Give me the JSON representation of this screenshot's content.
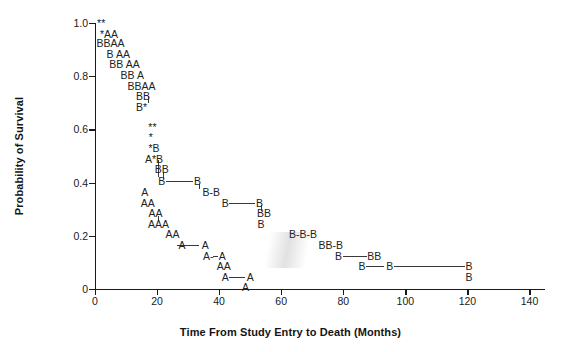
{
  "figure": {
    "background": "#ffffff",
    "ink": "#1a1a1a"
  },
  "axes": {
    "x_title": "Time From Study Entry to Death (Months)",
    "y_title": "Probability of Survival",
    "x_ticks": [
      "0",
      "20",
      "40",
      "60",
      "80",
      "100",
      "120",
      "140"
    ],
    "x_tick_values": [
      0,
      20,
      40,
      60,
      80,
      100,
      120,
      140
    ],
    "y_ticks": [
      "0",
      "0.2",
      "0.4",
      "0.6",
      "0.8",
      "1.0"
    ],
    "y_tick_values": [
      0,
      0.2,
      0.4,
      0.6,
      0.8,
      1.0
    ],
    "xlim": [
      0,
      145
    ],
    "ylim": [
      0,
      1.0
    ],
    "grid": false
  },
  "legend": {
    "present": false,
    "marker_meanings": [
      {
        "symbol": "A",
        "meaning": "group-a-observation"
      },
      {
        "symbol": "B",
        "meaning": "group-b-observation"
      },
      {
        "symbol": "*",
        "meaning": "censored-observation"
      }
    ]
  },
  "chart_data": {
    "type": "line",
    "title": "",
    "subtitle": "",
    "xlabel": "Time From Study Entry to Death (Months)",
    "ylabel": "Probability of Survival",
    "xlim": [
      0,
      145
    ],
    "ylim": [
      0,
      1.0
    ],
    "grid": false,
    "legend_position": "none",
    "plot_style": "kaplan-meier-step-with-text-markers",
    "series": [
      {
        "name": "A",
        "marker": "A",
        "points": [
          {
            "x": 3.5,
            "y": 0.96
          },
          {
            "x": 6.0,
            "y": 0.96
          },
          {
            "x": 5.0,
            "y": 0.925
          },
          {
            "x": 7.5,
            "y": 0.925
          },
          {
            "x": 8.5,
            "y": 0.885
          },
          {
            "x": 11.0,
            "y": 0.885
          },
          {
            "x": 11.0,
            "y": 0.845
          },
          {
            "x": 13.5,
            "y": 0.845
          },
          {
            "x": 13.5,
            "y": 0.805
          },
          {
            "x": 15.5,
            "y": 0.765
          },
          {
            "x": 18.0,
            "y": 0.765
          },
          {
            "x": 19.0,
            "y": 0.49
          },
          {
            "x": 15.5,
            "y": 0.405
          },
          {
            "x": 15.5,
            "y": 0.365
          },
          {
            "x": 18.0,
            "y": 0.365
          },
          {
            "x": 18.5,
            "y": 0.325
          },
          {
            "x": 21.0,
            "y": 0.325
          },
          {
            "x": 18.5,
            "y": 0.245
          },
          {
            "x": 21.0,
            "y": 0.245
          },
          {
            "x": 23.5,
            "y": 0.245
          },
          {
            "x": 24.5,
            "y": 0.205
          },
          {
            "x": 27.0,
            "y": 0.205
          },
          {
            "x": 27.0,
            "y": 0.165
          },
          {
            "x": 34.0,
            "y": 0.165
          },
          {
            "x": 36.0,
            "y": 0.125
          },
          {
            "x": 40.0,
            "y": 0.125
          },
          {
            "x": 40.0,
            "y": 0.085
          },
          {
            "x": 42.5,
            "y": 0.085
          },
          {
            "x": 41.5,
            "y": 0.045
          },
          {
            "x": 49.5,
            "y": 0.045
          },
          {
            "x": 48.5,
            "y": 0.008
          }
        ]
      },
      {
        "name": "B",
        "marker": "B",
        "points": [
          {
            "x": 2.5,
            "y": 0.925
          },
          {
            "x": 5.0,
            "y": 0.925
          },
          {
            "x": 3.5,
            "y": 0.885
          },
          {
            "x": 4.5,
            "y": 0.845
          },
          {
            "x": 7.0,
            "y": 0.845
          },
          {
            "x": 6.5,
            "y": 0.805
          },
          {
            "x": 9.0,
            "y": 0.805
          },
          {
            "x": 8.5,
            "y": 0.765
          },
          {
            "x": 11.0,
            "y": 0.765
          },
          {
            "x": 10.5,
            "y": 0.725
          },
          {
            "x": 13.0,
            "y": 0.725
          },
          {
            "x": 12.0,
            "y": 0.645
          },
          {
            "x": 18.5,
            "y": 0.53
          },
          {
            "x": 19.5,
            "y": 0.49
          },
          {
            "x": 20.5,
            "y": 0.45
          },
          {
            "x": 23.0,
            "y": 0.45
          },
          {
            "x": 22.5,
            "y": 0.405
          },
          {
            "x": 33.0,
            "y": 0.405
          },
          {
            "x": 33.0,
            "y": 0.365
          },
          {
            "x": 37.0,
            "y": 0.365
          },
          {
            "x": 41.0,
            "y": 0.365
          },
          {
            "x": 41.0,
            "y": 0.325
          },
          {
            "x": 51.0,
            "y": 0.325
          },
          {
            "x": 51.0,
            "y": 0.285
          },
          {
            "x": 54.0,
            "y": 0.285
          },
          {
            "x": 52.5,
            "y": 0.245
          },
          {
            "x": 63.0,
            "y": 0.245
          },
          {
            "x": 63.0,
            "y": 0.205
          },
          {
            "x": 67.5,
            "y": 0.205
          },
          {
            "x": 72.0,
            "y": 0.205
          },
          {
            "x": 72.5,
            "y": 0.165
          },
          {
            "x": 76.5,
            "y": 0.165
          },
          {
            "x": 81.0,
            "y": 0.165
          },
          {
            "x": 77.5,
            "y": 0.125
          },
          {
            "x": 88.0,
            "y": 0.125
          },
          {
            "x": 91.0,
            "y": 0.125
          },
          {
            "x": 85.5,
            "y": 0.085
          },
          {
            "x": 94.0,
            "y": 0.085
          },
          {
            "x": 120.0,
            "y": 0.085
          },
          {
            "x": 120.0,
            "y": 0.045
          }
        ]
      },
      {
        "name": "Censored",
        "marker": "*",
        "points": [
          {
            "x": 1.0,
            "y": 1.0
          },
          {
            "x": 3.0,
            "y": 1.0
          },
          {
            "x": 2.0,
            "y": 0.96
          },
          {
            "x": 14.5,
            "y": 0.725
          },
          {
            "x": 14.0,
            "y": 0.645
          },
          {
            "x": 16.5,
            "y": 0.61
          },
          {
            "x": 19.0,
            "y": 0.61
          },
          {
            "x": 17.5,
            "y": 0.57
          },
          {
            "x": 18.0,
            "y": 0.53
          },
          {
            "x": 18.0,
            "y": 0.49
          }
        ]
      }
    ]
  },
  "markers": [
    {
      "t": "**",
      "x": 2.0,
      "y": 1.0
    },
    {
      "t": "*AA",
      "x": 4.5,
      "y": 0.96
    },
    {
      "t": "BBAA",
      "x": 5.0,
      "y": 0.925
    },
    {
      "t": "B AA",
      "x": 7.5,
      "y": 0.885
    },
    {
      "t": "BB AA",
      "x": 9.5,
      "y": 0.845
    },
    {
      "t": "BB A",
      "x": 12.0,
      "y": 0.805
    },
    {
      "t": "BBAA",
      "x": 15.0,
      "y": 0.765
    },
    {
      "t": "BB",
      "x": 15.5,
      "y": 0.725
    },
    {
      "t": "B*",
      "x": 15.0,
      "y": 0.685
    },
    {
      "t": "**",
      "x": 18.5,
      "y": 0.61
    },
    {
      "t": "*",
      "x": 18.0,
      "y": 0.57
    },
    {
      "t": "*B",
      "x": 19.0,
      "y": 0.53
    },
    {
      "t": "A*B",
      "x": 19.0,
      "y": 0.49
    },
    {
      "t": "BB",
      "x": 21.5,
      "y": 0.45
    },
    {
      "t": "B",
      "x": 21.5,
      "y": 0.405
    },
    {
      "t": "B",
      "x": 33.0,
      "y": 0.405
    },
    {
      "t": "A",
      "x": 16.0,
      "y": 0.365
    },
    {
      "t": "B-B",
      "x": 37.5,
      "y": 0.365
    },
    {
      "t": "AA",
      "x": 17.0,
      "y": 0.325
    },
    {
      "t": "B",
      "x": 42.0,
      "y": 0.325
    },
    {
      "t": "B",
      "x": 53.0,
      "y": 0.325
    },
    {
      "t": "AA",
      "x": 19.5,
      "y": 0.285
    },
    {
      "t": "BB",
      "x": 54.5,
      "y": 0.285
    },
    {
      "t": "AAA",
      "x": 20.5,
      "y": 0.245
    },
    {
      "t": "B",
      "x": 53.5,
      "y": 0.245
    },
    {
      "t": "AA",
      "x": 25.0,
      "y": 0.205
    },
    {
      "t": "B-B-B",
      "x": 67.0,
      "y": 0.205
    },
    {
      "t": "A",
      "x": 28.0,
      "y": 0.165
    },
    {
      "t": "A",
      "x": 35.5,
      "y": 0.165
    },
    {
      "t": "BB-B",
      "x": 76.0,
      "y": 0.165
    },
    {
      "t": "A-",
      "x": 36.5,
      "y": 0.125
    },
    {
      "t": "A",
      "x": 41.0,
      "y": 0.125
    },
    {
      "t": "B",
      "x": 78.5,
      "y": 0.125
    },
    {
      "t": "BB",
      "x": 90.0,
      "y": 0.125
    },
    {
      "t": "AA",
      "x": 41.5,
      "y": 0.085
    },
    {
      "t": "B",
      "x": 86.0,
      "y": 0.085
    },
    {
      "t": "B",
      "x": 95.0,
      "y": 0.085
    },
    {
      "t": "B",
      "x": 120.5,
      "y": 0.085
    },
    {
      "t": "A",
      "x": 42.0,
      "y": 0.045
    },
    {
      "t": "A",
      "x": 50.0,
      "y": 0.045
    },
    {
      "t": "B",
      "x": 120.5,
      "y": 0.045
    },
    {
      "t": "A",
      "x": 48.5,
      "y": 0.008
    }
  ],
  "segments_h": [
    {
      "x1": 22.8,
      "x2": 31.6,
      "y": 0.405
    },
    {
      "x1": 43.3,
      "x2": 51.4,
      "y": 0.325
    },
    {
      "x1": 26.5,
      "x2": 33.6,
      "y": 0.165
    },
    {
      "x1": 38.0,
      "x2": 39.6,
      "y": 0.125
    },
    {
      "x1": 43.3,
      "x2": 48.4,
      "y": 0.045
    },
    {
      "x1": 87.4,
      "x2": 93.2,
      "y": 0.085
    },
    {
      "x1": 96.4,
      "x2": 119.1,
      "y": 0.085
    },
    {
      "x1": 79.9,
      "x2": 87.6,
      "y": 0.125
    }
  ],
  "segments_v": [
    {
      "x": 17.2,
      "y1": 0.725,
      "y2": 0.7
    },
    {
      "x": 20.2,
      "y1": 0.485,
      "y2": 0.42
    },
    {
      "x": 22.0,
      "y1": 0.44,
      "y2": 0.415
    },
    {
      "x": 33.6,
      "y1": 0.395,
      "y2": 0.375
    },
    {
      "x": 53.4,
      "y1": 0.315,
      "y2": 0.295
    },
    {
      "x": 20.2,
      "y1": 0.275,
      "y2": 0.255
    }
  ]
}
